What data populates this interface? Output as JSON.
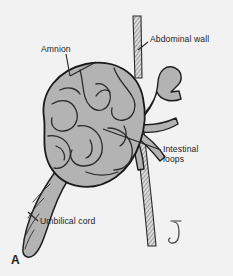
{
  "figure": {
    "panel_letter": "A",
    "background_color": "#f2f2f2",
    "ink_color": "#232323",
    "tissue_fill_color": "#b3b3b3",
    "wall_fill_color": "#d9d9d9",
    "signature_mark": "artist-signature-glyph"
  },
  "labels": {
    "amnion": "Amnion",
    "abdominal_wall": "Abdominal wall",
    "intestinal_loops_line1": "Intestinal",
    "intestinal_loops_line2": "loops",
    "umbilical_cord": "Umbilical cord"
  },
  "anatomy": {
    "hernia_sac": "amnion-covered-sac",
    "bowel_loops": "herniated-intestinal-loops",
    "abdominal_wall_upper": "abdominal-wall-upper-segment",
    "abdominal_wall_lower": "abdominal-wall-lower-segment",
    "umbilical_cord": "coiled-umbilical-cord",
    "exiting_loops": "bowel-loops-entering-abdomen"
  }
}
